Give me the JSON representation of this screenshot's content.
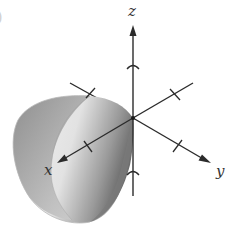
{
  "figure": {
    "type": "3d-surface-plot",
    "surface": "elliptic paraboloid opening along the positive x-axis with vertex at the origin",
    "edge_fragment": ")",
    "axes": {
      "x": {
        "label": "x",
        "ticks": 2
      },
      "y": {
        "label": "y",
        "ticks": 2
      },
      "z": {
        "label": "z",
        "ticks": 2
      }
    },
    "colors": {
      "axis": "#2b2b2b",
      "surface_dark": "#8a8a8a",
      "surface_mid": "#bdbdbd",
      "surface_light": "#ededed",
      "background": "#ffffff"
    }
  }
}
